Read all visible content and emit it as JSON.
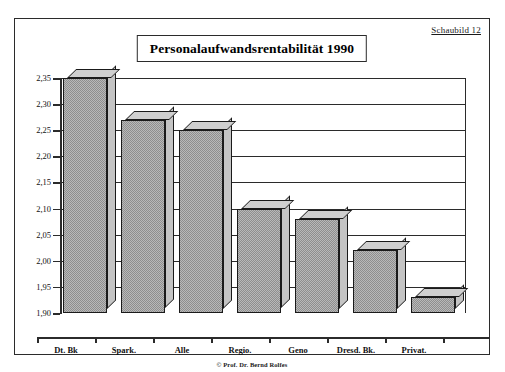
{
  "figure": {
    "caption_label": "Schaubild 12",
    "copyright": "© Prof. Dr. Bernd Rolfes"
  },
  "chart_data": {
    "type": "bar",
    "title": "Personalaufwandsrentabilität  1990",
    "xlabel": "",
    "ylabel": "",
    "categories": [
      "Dt. Bk",
      "Spark.",
      "Alle",
      "Regio.",
      "Geno",
      "Dresd. Bk.",
      "Privat."
    ],
    "values": [
      2.35,
      2.27,
      2.25,
      2.1,
      2.08,
      2.02,
      1.93
    ],
    "ylim": [
      1.9,
      2.35
    ],
    "ytick_labels": [
      "2,35",
      "2,30",
      "2,25",
      "2,20",
      "2,15",
      "2,10",
      "2,05",
      "2,00",
      "1,95",
      "1,90"
    ],
    "ytick_values": [
      2.35,
      2.3,
      2.25,
      2.2,
      2.15,
      2.1,
      2.05,
      2.0,
      1.95,
      1.9
    ],
    "grid": true,
    "legend": false,
    "style_3d": true,
    "colors": {
      "bar_face": "#b9b9b9",
      "bar_top": "#cfcfcf",
      "bar_side": "#c4c4c4",
      "outline": "#1a1a1a",
      "frame": "#2b2b2b"
    }
  }
}
